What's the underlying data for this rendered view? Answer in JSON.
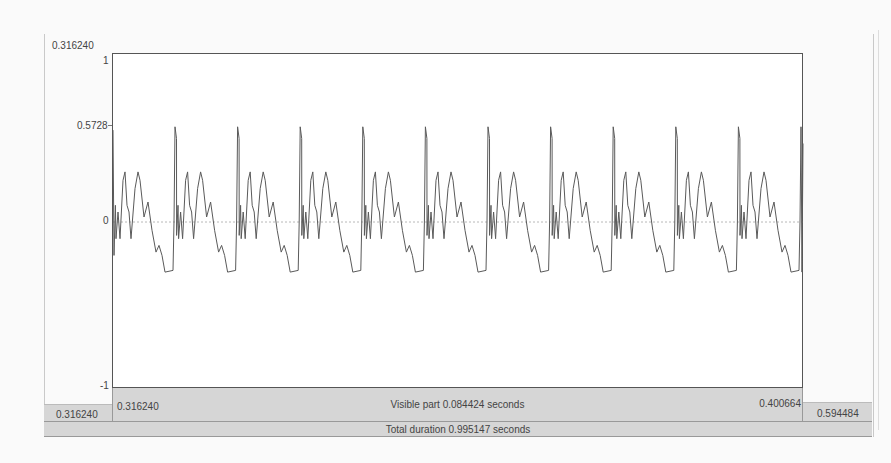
{
  "window": {
    "app": "Praat Sound editor"
  },
  "waveform": {
    "top_time_label": "0.316240",
    "y_axis": {
      "max_label": "1",
      "marker_label": "0.5728",
      "zero_label": "0",
      "min_label": "-1",
      "ylim": [
        -1,
        1
      ],
      "marker_value": 0.5728
    },
    "stroke_color": "#5a5a5a",
    "zero_line_color": "#b0b0b0",
    "periods_visible": 11,
    "peak_value": 0.5728
  },
  "time_bar": {
    "left_total_start": "0.316240",
    "visible_start": "0.316240",
    "visible_part": "Visible part 0.084424 seconds",
    "visible_end": "0.400664",
    "right_total_end": "0.594484",
    "total_duration": "Total duration 0.995147 seconds"
  },
  "colors": {
    "bar_bg": "#d6d6d6",
    "plot_bg": "#ffffff",
    "page_bg": "#fafafa",
    "border": "#555555"
  }
}
